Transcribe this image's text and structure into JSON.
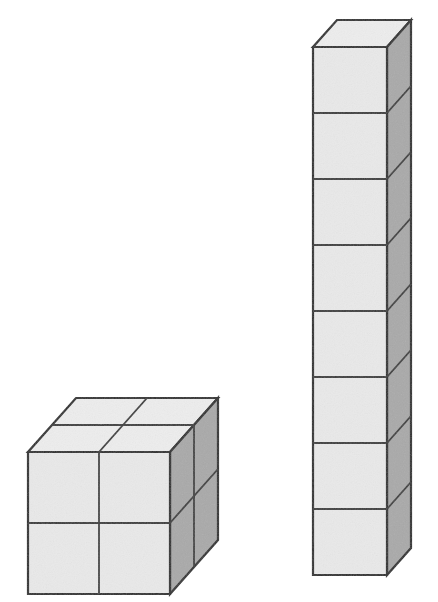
{
  "scene": {
    "title": "Two cube structures",
    "background_color": "#ffffff",
    "canvas_width": 438,
    "canvas_height": 602,
    "figure_count": 2,
    "projection": "oblique-cabinet"
  },
  "palette": {
    "front_face": "#e9e9e9",
    "top_face": "#ededed",
    "side_face": "#a9a9a9",
    "outline": "#2b2b2b",
    "inner_line": "#3a3a3a",
    "background": "#ffffff"
  },
  "geometry": {
    "depth_dx": 24,
    "depth_dy": -27,
    "outline_width": 2.2,
    "inner_width": 1.8
  },
  "figures": [
    {
      "id": "left-block",
      "name": "two-by-two-by-two-block",
      "shape": "rectangular-prism",
      "columns": 2,
      "rows": 2,
      "layers": 2,
      "cube_count": 8,
      "origin_x": 28,
      "origin_y": 452,
      "cell": 71,
      "front_visible_cells": 4,
      "top_visible_cells": 4,
      "side_visible_cells": 4
    },
    {
      "id": "right-tower",
      "name": "one-by-one-by-eight-tower",
      "shape": "vertical-column",
      "columns": 1,
      "rows": 8,
      "layers": 1,
      "cube_count": 8,
      "origin_x": 313,
      "origin_y": 47,
      "cell_w": 74,
      "cell_h": 66,
      "front_visible_cells": 8,
      "top_visible_cells": 1,
      "side_visible_cells": 8
    }
  ],
  "chart_data": {
    "type": "bar",
    "categories": [
      "Left block (2x2x2)",
      "Right tower (1x1x8)"
    ],
    "values": [
      8,
      8
    ],
    "xlabel": "Structure",
    "ylabel": "Number of unit cubes",
    "ylim": [
      0,
      8
    ],
    "grid": false,
    "legend": "none"
  }
}
